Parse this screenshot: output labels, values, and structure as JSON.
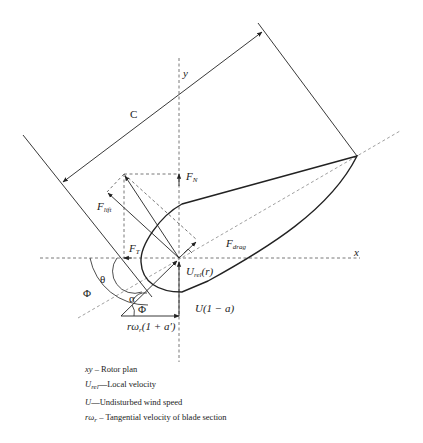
{
  "diagram": {
    "labels": {
      "chord": "C",
      "y_axis": "y",
      "x_axis": "x",
      "f_normal": "F",
      "f_normal_sub": "N",
      "f_lift": "F",
      "f_lift_sub": "lift",
      "f_drag": "F",
      "f_drag_sub": "drag",
      "f_tangential": "F",
      "f_tangential_sub": "T",
      "u_rel": "U",
      "u_rel_sub": "rel",
      "u_rel_arg": "(r)",
      "theta": "θ",
      "phi_outer": "Φ",
      "phi_inner": "Φ",
      "alpha": "α",
      "u_axial": "U(1 − a)",
      "rotational": "rω",
      "rotational_sub": "r",
      "rotational_tail": "(1 + a′)"
    },
    "legend": [
      {
        "symbol": "xy",
        "separator": " – ",
        "text": "Rotor plan"
      },
      {
        "symbol": "U",
        "symbol_sub": "rel",
        "separator": "—",
        "text": "Local velocity"
      },
      {
        "symbol": "U",
        "separator": "—",
        "text": "Undisturbed wind speed"
      },
      {
        "symbol": "rω",
        "symbol_sub": "r",
        "separator": " – ",
        "text": "Tangential velocity of blade section"
      }
    ],
    "colors": {
      "stroke": "#222222",
      "dashed": "#555555",
      "background": "#ffffff"
    }
  }
}
